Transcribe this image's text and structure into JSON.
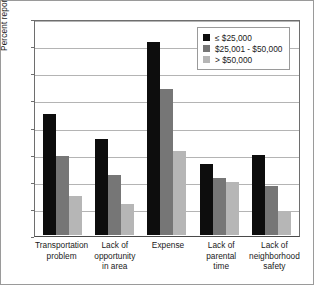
{
  "chart_data": {
    "type": "bar",
    "title": "",
    "subtitle": "",
    "xlabel": "",
    "ylabel": "Percent reporting barriers",
    "ylim": [
      0,
      80
    ],
    "ytick_step": 10,
    "yticks": [
      "80",
      "70",
      "60",
      "50",
      "40",
      "30",
      "20",
      "10",
      "0"
    ],
    "grid": true,
    "legend_position": "top-right",
    "categories": [
      "Transportation problem",
      "Lack of opportunity in area",
      "Expense",
      "Lack of parental time",
      "Lack of neighborhood safety"
    ],
    "category_lines": [
      [
        "Transportation",
        "problem"
      ],
      [
        "Lack of",
        "opportunity",
        "in area"
      ],
      [
        "Expense"
      ],
      [
        "Lack of",
        "parental",
        "time"
      ],
      [
        "Lack of",
        "neighborhood",
        "safety"
      ]
    ],
    "series": [
      {
        "name": "≤ $25,000",
        "color": "#0d0d0d",
        "values": [
          44.5,
          35.5,
          71,
          26,
          29.5
        ]
      },
      {
        "name": "$25,001 - $50,000",
        "color": "#767676",
        "values": [
          29,
          22,
          54,
          21,
          18
        ]
      },
      {
        "name": "> $50,000",
        "color": "#b6b6b6",
        "values": [
          14.5,
          11.5,
          31,
          19.5,
          9
        ]
      }
    ]
  },
  "legend": {
    "entries": [
      {
        "label": "≤ $25,000"
      },
      {
        "label": "$25,001 - $50,000"
      },
      {
        "label": "> $50,000"
      }
    ]
  }
}
